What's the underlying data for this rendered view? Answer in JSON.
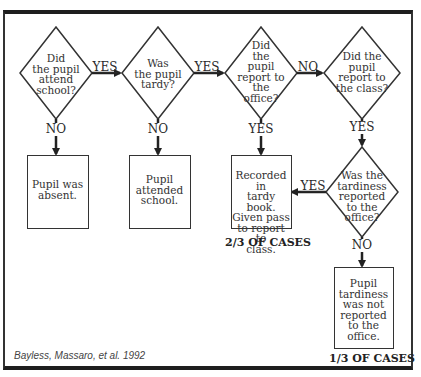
{
  "diagram": {
    "type": "flowchart",
    "decisions": [
      {
        "id": "attend",
        "text": "Did\nthe pupil\nattend\nschool?"
      },
      {
        "id": "tardy",
        "text": "Was\nthe pupil\ntardy?"
      },
      {
        "id": "report_office",
        "text": "Did\nthe\npupil\nreport to\nthe\noffice?"
      },
      {
        "id": "report_class",
        "text": "Did the\npupil\nreport to\nthe class?"
      },
      {
        "id": "tardiness_reported",
        "text": "Was the\ntardiness\nreported\nto the\noffice?"
      }
    ],
    "outcomes": [
      {
        "id": "absent",
        "text": "Pupil was\nabsent."
      },
      {
        "id": "attended",
        "text": "Pupil\nattended\nschool."
      },
      {
        "id": "recorded",
        "text": "Recorded in\ntardy book.\nGiven pass\nto report to\nclass."
      },
      {
        "id": "not_reported",
        "text": "Pupil\ntardiness\nwas not\nreported\nto the\noffice."
      }
    ],
    "edge_labels": {
      "attend_yes": "YES",
      "attend_no": "NO",
      "tardy_yes": "YES",
      "tardy_no": "NO",
      "office_no": "NO",
      "office_yes": "YES",
      "class_yes": "YES",
      "tardiness_yes": "YES",
      "tardiness_no": "NO"
    },
    "case_labels": {
      "recorded": "2/3 OF CASES",
      "not_reported": "1/3 OF CASES"
    },
    "citation": "Bayless, Massaro, et al. 1992"
  }
}
